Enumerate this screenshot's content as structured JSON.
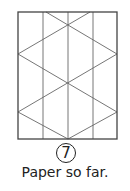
{
  "diagram": {
    "line_color": "#555555",
    "border_color": "#444444"
  },
  "step": {
    "number": "7",
    "caption": "Paper so far."
  }
}
